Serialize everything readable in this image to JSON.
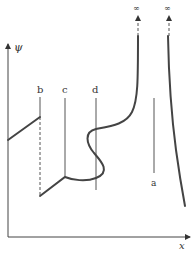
{
  "diagram": {
    "axes": {
      "y_label": "ψ",
      "x_label": "x"
    },
    "lines": {
      "a": {
        "label": "a"
      },
      "b": {
        "label": "b"
      },
      "c": {
        "label": "c"
      },
      "d": {
        "label": "d"
      }
    },
    "infinity": {
      "left": "∞",
      "right": "∞"
    },
    "colors": {
      "stroke": "#444444",
      "thin": "#555555"
    }
  }
}
